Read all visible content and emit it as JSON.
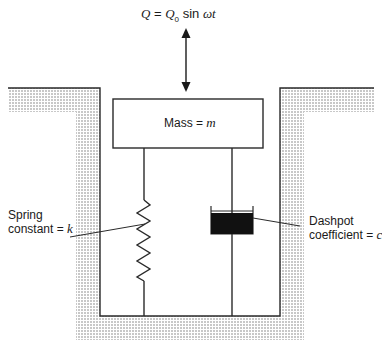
{
  "diagram": {
    "force": {
      "lhs": "Q",
      "eq": " = ",
      "amp": "Q",
      "amp_sub": "0",
      "func": " sin ",
      "omega_t": "ωt"
    },
    "mass": {
      "label": "Mass = ",
      "symbol": "m"
    },
    "spring": {
      "line1": "Spring",
      "line2": "constant = ",
      "symbol": "k"
    },
    "dashpot": {
      "line1": "Dashpot",
      "line2": "coefficient = ",
      "symbol": "c"
    },
    "colors": {
      "line": "#2a2a2a",
      "ground_fill": "#c8c8c8",
      "dashpot_fill": "#111111"
    }
  }
}
